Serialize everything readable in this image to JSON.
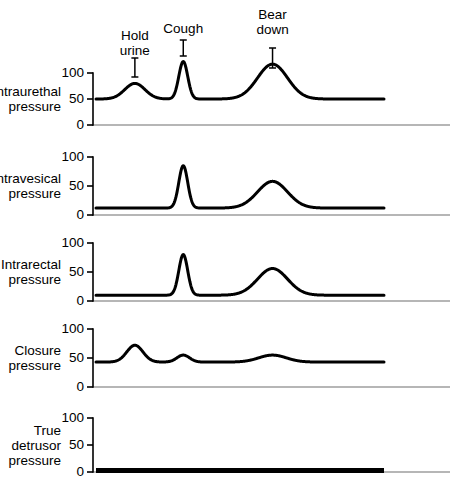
{
  "chart_data": {
    "type": "line",
    "title": "",
    "xlabel": "",
    "ylabel": "",
    "grid": false,
    "legend": "none",
    "ylim": [
      0,
      100
    ],
    "y_ticks": [
      0,
      50,
      100
    ],
    "y_tick_labels": [
      "0",
      "50",
      "100"
    ],
    "x_events": [
      {
        "name": "hold-urine",
        "label_line1": "Hold",
        "label_line2": "urine",
        "x_fraction": 0.135
      },
      {
        "name": "cough",
        "label_line1": "Cough",
        "label_line2": "",
        "x_fraction": 0.303
      },
      {
        "name": "bear-down",
        "label_line1": "Bear",
        "label_line2": "down",
        "x_fraction": 0.613
      }
    ],
    "panels": [
      {
        "name": "intraurethral-pressure",
        "label_line1": "Intraurethal",
        "label_line2": "pressure",
        "baseline": 50,
        "peaks": [
          {
            "event": "hold-urine",
            "value": 80
          },
          {
            "event": "cough",
            "value": 122
          },
          {
            "event": "bear-down",
            "value": 117
          }
        ]
      },
      {
        "name": "intravesical-pressure",
        "label_line1": "Intravesical",
        "label_line2": "pressure",
        "baseline": 12,
        "peaks": [
          {
            "event": "cough",
            "value": 85
          },
          {
            "event": "bear-down",
            "value": 58
          }
        ]
      },
      {
        "name": "intrarectal-pressure",
        "label_line1": "Intrarectal",
        "label_line2": "pressure",
        "baseline": 10,
        "peaks": [
          {
            "event": "cough",
            "value": 80
          },
          {
            "event": "bear-down",
            "value": 56
          }
        ]
      },
      {
        "name": "closure-pressure",
        "label_line1": "Closure",
        "label_line2": "pressure",
        "baseline": 43,
        "peaks": [
          {
            "event": "hold-urine",
            "value": 72
          },
          {
            "event": "cough",
            "value": 55
          },
          {
            "event": "bear-down",
            "value": 55
          }
        ]
      },
      {
        "name": "true-detrusor-pressure",
        "label_line1": "True",
        "label_line2": "detrusor",
        "label_line3": "pressure",
        "baseline": 3,
        "peaks": []
      }
    ],
    "colors": {
      "trace": "#000000",
      "axis": "#000000",
      "baseline_rule": "#6e6e6e",
      "background": "#ffffff"
    }
  }
}
